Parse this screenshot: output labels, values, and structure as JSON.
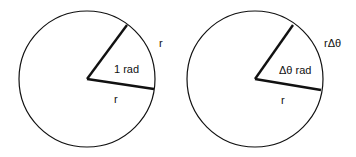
{
  "diagrams": [
    {
      "arc_label": "r",
      "angle_label": "1 rad",
      "radius_label": "r"
    },
    {
      "arc_label": "rΔθ",
      "angle_label": "Δθ rad",
      "radius_label": "r"
    }
  ],
  "colors": {
    "stroke": "#111111",
    "background": "#ffffff"
  }
}
